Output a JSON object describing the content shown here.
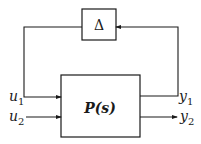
{
  "diagram": {
    "type": "block-diagram",
    "blocks": {
      "uncertainty": {
        "label": "Δ"
      },
      "plant": {
        "label": "P(s)"
      }
    },
    "signals": {
      "u1": {
        "base": "u",
        "sub": "1"
      },
      "u2": {
        "base": "u",
        "sub": "2"
      },
      "y1": {
        "base": "y",
        "sub": "1"
      },
      "y2": {
        "base": "y",
        "sub": "2"
      }
    },
    "connections": [
      {
        "from": "uncertainty",
        "to": "plant",
        "signal": "u1"
      },
      {
        "from": "external",
        "to": "plant",
        "signal": "u2"
      },
      {
        "from": "plant",
        "to": "uncertainty",
        "signal": "y1"
      },
      {
        "from": "plant",
        "to": "external",
        "signal": "y2"
      }
    ],
    "colors": {
      "line": "#1a1a1a",
      "background": "#ffffff"
    }
  }
}
